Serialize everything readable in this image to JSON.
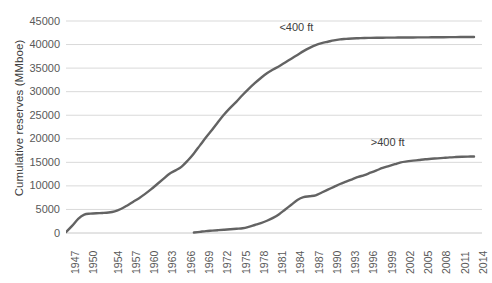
{
  "chart_data": {
    "type": "line",
    "title": "",
    "xlabel": "",
    "ylabel": "Cumulative reserves (MMboe)",
    "ylim": [
      0,
      45000
    ],
    "ytick_labels": [
      "45000",
      "40000",
      "35000",
      "30000",
      "25000",
      "20000",
      "15000",
      "10000",
      "5000",
      "0"
    ],
    "ytick_values": [
      45000,
      40000,
      35000,
      30000,
      25000,
      20000,
      15000,
      10000,
      5000,
      0
    ],
    "grid": true,
    "legend_position": "inline-annotation",
    "x": [
      1947,
      1948,
      1949,
      1950,
      1951,
      1952,
      1953,
      1954,
      1955,
      1956,
      1957,
      1958,
      1959,
      1960,
      1961,
      1962,
      1963,
      1964,
      1965,
      1966,
      1967,
      1968,
      1969,
      1970,
      1971,
      1972,
      1973,
      1974,
      1975,
      1976,
      1977,
      1978,
      1979,
      1980,
      1981,
      1982,
      1983,
      1984,
      1985,
      1986,
      1987,
      1988,
      1989,
      1990,
      1991,
      1992,
      1993,
      1994,
      1995,
      1996,
      1997,
      1998,
      1999,
      2000,
      2001,
      2002,
      2003,
      2004,
      2005,
      2006,
      2007,
      2008,
      2009,
      2010,
      2011,
      2012,
      2013,
      2014
    ],
    "xtick_labels": [
      "1947",
      "1950",
      "1954",
      "1957",
      "1960",
      "1963",
      "1966",
      "1969",
      "1972",
      "1975",
      "1978",
      "1981",
      "1984",
      "1987",
      "1990",
      "1993",
      "1996",
      "1999",
      "2002",
      "2005",
      "2008",
      "2011",
      "2014"
    ],
    "series": [
      {
        "name": "<400 ft",
        "color": "#636363",
        "label_x_year": 1985,
        "label_y_value": 43500,
        "values": [
          200,
          1500,
          3000,
          3900,
          4100,
          4200,
          4250,
          4350,
          4600,
          5100,
          5800,
          6600,
          7400,
          8300,
          9300,
          10400,
          11500,
          12600,
          13300,
          14100,
          15400,
          16900,
          18600,
          20300,
          21900,
          23600,
          25200,
          26600,
          27900,
          29300,
          30600,
          31800,
          32900,
          33900,
          34700,
          35400,
          36200,
          37000,
          37800,
          38600,
          39300,
          39900,
          40300,
          40600,
          40900,
          41100,
          41200,
          41300,
          41350,
          41400,
          41420,
          41440,
          41460,
          41470,
          41480,
          41490,
          41500,
          41510,
          41520,
          41530,
          41540,
          41550,
          41560,
          41570,
          41580,
          41590,
          41600,
          41610
        ]
      },
      {
        "name": ">400 ft",
        "color": "#636363",
        "label_x_year": 2000,
        "label_y_value": 19000,
        "start_year": 1968,
        "values": [
          null,
          null,
          null,
          null,
          null,
          null,
          null,
          null,
          null,
          null,
          null,
          null,
          null,
          null,
          null,
          null,
          null,
          null,
          null,
          null,
          null,
          100,
          250,
          400,
          500,
          600,
          700,
          800,
          900,
          1000,
          1300,
          1700,
          2100,
          2600,
          3200,
          4000,
          5000,
          6000,
          7000,
          7600,
          7800,
          8000,
          8600,
          9200,
          9800,
          10400,
          10900,
          11400,
          11900,
          12300,
          12800,
          13300,
          13800,
          14200,
          14600,
          15000,
          15200,
          15350,
          15500,
          15650,
          15750,
          15850,
          15950,
          16050,
          16120,
          16180,
          16220,
          16250
        ]
      }
    ]
  },
  "annotations": {
    "upper_label": "<400 ft",
    "lower_label": ">400 ft"
  },
  "style": {
    "line_color": "#636363",
    "grid_color": "#d9d9d9",
    "text_color": "#595959",
    "background": "#ffffff"
  }
}
